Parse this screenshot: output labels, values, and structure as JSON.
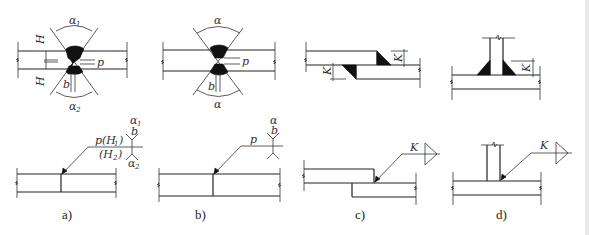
{
  "figure": {
    "panels": [
      {
        "id": "a",
        "caption": "a)",
        "type": "double-V butt weld, unequal",
        "section_labels": {
          "alpha_top": "α",
          "alpha_top_sub": "1",
          "alpha_bottom": "α",
          "alpha_bottom_sub": "2",
          "H1": "H",
          "H1_sub": "1",
          "H2": "H",
          "H2_sub": "2",
          "p": "p",
          "b": "b"
        },
        "symbol_labels": {
          "upper": "p(H",
          "upper_sub": "1",
          "upper_close": ")",
          "lower": "(H",
          "lower_sub": "2",
          "lower_close": ")",
          "alpha_top": "α",
          "alpha_top_sub": "1",
          "b": "b",
          "alpha_bottom": "α",
          "alpha_bottom_sub": "2"
        }
      },
      {
        "id": "b",
        "caption": "b)",
        "type": "double-V butt weld, symmetric",
        "section_labels": {
          "alpha_top": "α",
          "alpha_bottom": "α",
          "p": "p",
          "b": "b"
        },
        "symbol_labels": {
          "upper": "p",
          "alpha": "α",
          "b": "b"
        }
      },
      {
        "id": "c",
        "caption": "c)",
        "type": "lap joint fillet welds",
        "section_labels": {
          "k_top": "K",
          "k_bottom": "K"
        },
        "symbol_labels": {
          "k": "K"
        }
      },
      {
        "id": "d",
        "caption": "d)",
        "type": "T-joint double fillet welds",
        "section_labels": {
          "k": "K"
        },
        "symbol_labels": {
          "k": "K"
        }
      }
    ],
    "colors": {
      "line": "#222222",
      "weld_fill": "#111111",
      "background": "#ffffff"
    }
  }
}
